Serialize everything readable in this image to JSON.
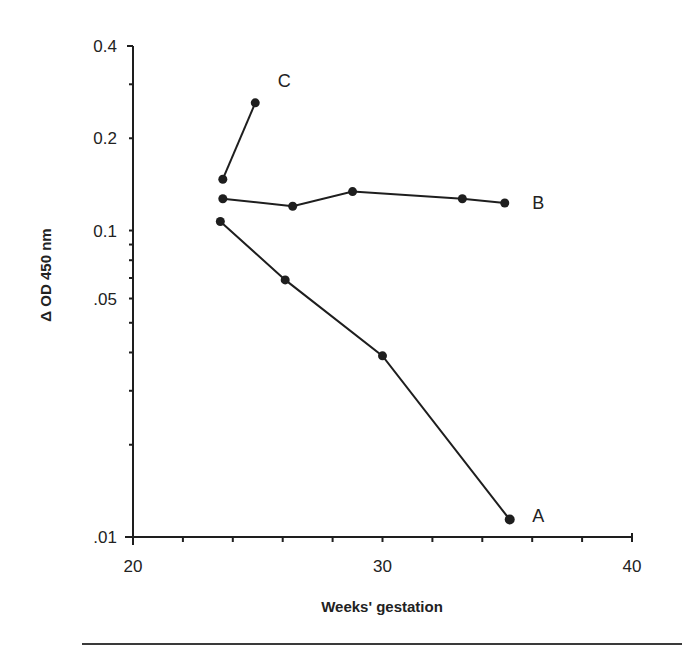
{
  "chart_data": {
    "type": "line",
    "title": "",
    "xlabel": "Weeks' gestation",
    "ylabel": "Δ OD 450 nm",
    "xlim": [
      20,
      40
    ],
    "ylim": [
      0.01,
      0.4
    ],
    "yscale": "log",
    "grid": false,
    "legend": "direct labels at line ends",
    "x_ticks": [
      20,
      22,
      24,
      26,
      28,
      30,
      32,
      34,
      36,
      38,
      40
    ],
    "x_tick_labels": [
      {
        "value": 20,
        "label": "20"
      },
      {
        "value": 30,
        "label": "30"
      },
      {
        "value": 40,
        "label": "40"
      }
    ],
    "y_ticks": [
      0.01,
      0.02,
      0.03,
      0.04,
      0.05,
      0.06,
      0.07,
      0.08,
      0.09,
      0.1,
      0.2,
      0.3,
      0.4
    ],
    "y_tick_labels": [
      {
        "value": 0.4,
        "label": "0.4"
      },
      {
        "value": 0.2,
        "label": "0.2"
      },
      {
        "value": 0.1,
        "label": "0.1"
      },
      {
        "value": 0.06,
        "label": ".05"
      },
      {
        "value": 0.01,
        "label": ".01"
      }
    ],
    "series": [
      {
        "name": "A",
        "x": [
          23.5,
          26.1,
          30.0,
          35.1
        ],
        "values": [
          0.107,
          0.069,
          0.039,
          0.0114
        ]
      },
      {
        "name": "B",
        "x": [
          23.6,
          26.4,
          28.8,
          33.2,
          34.9
        ],
        "values": [
          0.127,
          0.12,
          0.134,
          0.127,
          0.123
        ]
      },
      {
        "name": "C",
        "x": [
          23.6,
          24.9
        ],
        "values": [
          0.147,
          0.261
        ]
      }
    ],
    "series_label_positions": {
      "A": {
        "x": 36.0,
        "y": 0.0118
      },
      "B": {
        "x": 36.0,
        "y": 0.124
      },
      "C": {
        "x": 25.8,
        "y": 0.31
      }
    }
  },
  "layout": {
    "plot": {
      "left": 133,
      "right": 632,
      "top": 46,
      "bottom": 537
    },
    "colors": {
      "ink": "#1e1e1e",
      "background": "#ffffff"
    }
  }
}
